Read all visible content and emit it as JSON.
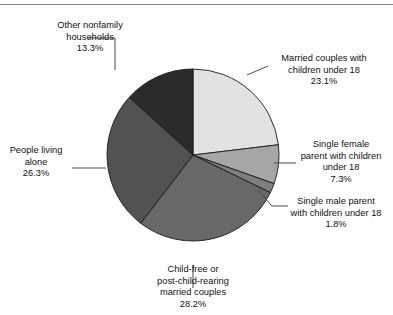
{
  "figure": {
    "has_top_rule": true,
    "background": "#ffffff",
    "text_color": "#111111"
  },
  "chart_data": {
    "type": "pie",
    "title": "",
    "subtitle": "",
    "xlabel": "",
    "ylabel": "",
    "legend_position": "callout-labels",
    "grid": false,
    "start_angle_deg": 0,
    "direction": "clockwise",
    "center": {
      "x": 193,
      "y": 155
    },
    "radius": 86,
    "total_percent": 100.0,
    "categories": [
      "Married couples with children under 18",
      "Single female parent with children under 18",
      "Single male parent with children under 18",
      "Child-free or post-child-rearing married couples",
      "People living alone",
      "Other nonfamily households"
    ],
    "values": [
      23.1,
      7.3,
      1.8,
      28.2,
      26.3,
      13.3
    ],
    "colors": [
      "#e2e2e2",
      "#a6a6a6",
      "#7e7e7e",
      "#686868",
      "#525252",
      "#2b2b2b"
    ],
    "slice_edge_color": "#1a1a1a",
    "slices": [
      {
        "name": "married-couples-with-children",
        "label_lines": [
          "Married couples with",
          "children under 18"
        ],
        "percent_text": "23.1%",
        "value": 23.1,
        "color": "#e2e2e2"
      },
      {
        "name": "single-female-parent",
        "label_lines": [
          "Single female",
          "parent with children",
          "under 18"
        ],
        "percent_text": "7.3%",
        "value": 7.3,
        "color": "#a6a6a6"
      },
      {
        "name": "single-male-parent",
        "label_lines": [
          "Single male parent",
          "with children under 18"
        ],
        "percent_text": "1.8%",
        "value": 1.8,
        "color": "#7e7e7e"
      },
      {
        "name": "child-free-married-couples",
        "label_lines": [
          "Child-free or",
          "post-child-rearing",
          "married couples"
        ],
        "percent_text": "28.2%",
        "value": 28.2,
        "color": "#686868"
      },
      {
        "name": "people-living-alone",
        "label_lines": [
          "People living",
          "alone"
        ],
        "percent_text": "26.3%",
        "value": 26.3,
        "color": "#525252"
      },
      {
        "name": "other-nonfamily-households",
        "label_lines": [
          "Other nonfamily",
          "households"
        ],
        "percent_text": "13.3%",
        "value": 13.3,
        "color": "#2b2b2b"
      }
    ]
  },
  "labels": {
    "married": {
      "line1": "Married couples with",
      "line2": "children under 18",
      "pct": "23.1%"
    },
    "female": {
      "line1": "Single female",
      "line2": "parent with children",
      "line3": "under 18",
      "pct": "7.3%"
    },
    "male": {
      "line1": "Single male parent",
      "line2": "with children under 18",
      "pct": "1.8%"
    },
    "childfree": {
      "line1": "Child-free or",
      "line2": "post-child-rearing",
      "line3": "married couples",
      "pct": "28.2%"
    },
    "alone": {
      "line1": "People living",
      "line2": "alone",
      "pct": "26.3%"
    },
    "nonfamily": {
      "line1": "Other nonfamily",
      "line2": "households",
      "pct": "13.3%"
    }
  }
}
